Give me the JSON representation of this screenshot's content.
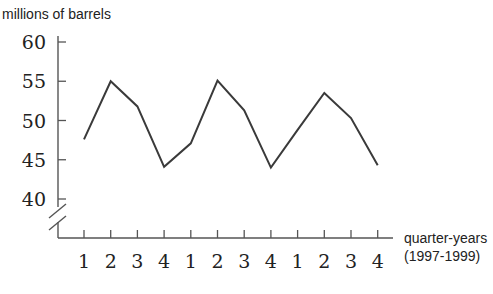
{
  "chart_data": {
    "type": "line",
    "title": "",
    "ylabel": "millions of barrels",
    "xlabel": "quarter-years",
    "xlabel_sub": "(1997-1999)",
    "categories": [
      "1",
      "2",
      "3",
      "4",
      "1",
      "2",
      "3",
      "4",
      "1",
      "2",
      "3",
      "4"
    ],
    "years": [
      "1997",
      "1997",
      "1997",
      "1997",
      "1998",
      "1998",
      "1998",
      "1998",
      "1999",
      "1999",
      "1999",
      "1999"
    ],
    "values": [
      47.6,
      55.0,
      51.8,
      44.1,
      47.1,
      55.1,
      51.3,
      44.0,
      48.8,
      53.5,
      50.3,
      44.3
    ],
    "yticks": [
      40,
      45,
      50,
      55,
      60
    ],
    "ytick_labels": [
      "40",
      "45",
      "50",
      "55",
      "60"
    ],
    "ylim": [
      40,
      60
    ],
    "y_axis_break": true,
    "grid": false,
    "legend": null
  },
  "colors": {
    "line": "#3a3a3a",
    "axis": "#555555",
    "text": "#222222"
  }
}
